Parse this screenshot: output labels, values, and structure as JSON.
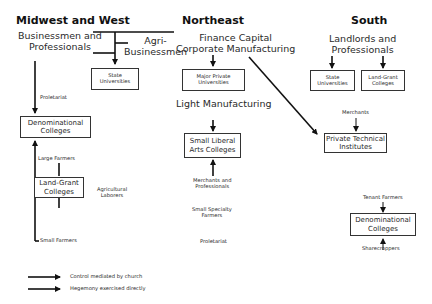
{
  "regions": {
    "midwest": "Midwest and West",
    "northeast": "Northeast",
    "south": "South"
  },
  "midwest": {
    "businessmen": "Businessmen and\nProfessionals",
    "agri": "Agri-\nBusinessmen",
    "state_univ": "State\nUniversities",
    "proletariat": "Proletariat",
    "denominational": "Denominational\nColleges",
    "large_farmers": "Large Farmers",
    "land_grant": "Land-Grant\nColleges",
    "ag_laborers": "Agricultural\nLaborers",
    "small_farmers": "Small Farmers"
  },
  "northeast": {
    "finance": "Finance Capital\nCorporate Manufacturing",
    "major_private": "Major Private\nUniversities",
    "light_mfg": "Light Manufacturing",
    "small_liberal": "Small Liberal\nArts Colleges",
    "merchants_prof": "Merchants and\nProfessionals",
    "specialty_farmers": "Small Specialty\nFarmers",
    "proletariat": "Proletariat"
  },
  "south": {
    "landlords": "Landlords and\nProfessionals",
    "state_univ": "State\nUniversities",
    "land_grant": "Land-Grant\nColleges",
    "merchants": "Merchants",
    "private_tech": "Private Technical\nInstitutes",
    "tenant_farmers": "Tenant Farmers",
    "denominational": "Denominational\nColleges",
    "sharecroppers": "Sharecroppers"
  },
  "legend": {
    "church": "Control mediated by church",
    "direct": "Hegemony exercised directly"
  }
}
